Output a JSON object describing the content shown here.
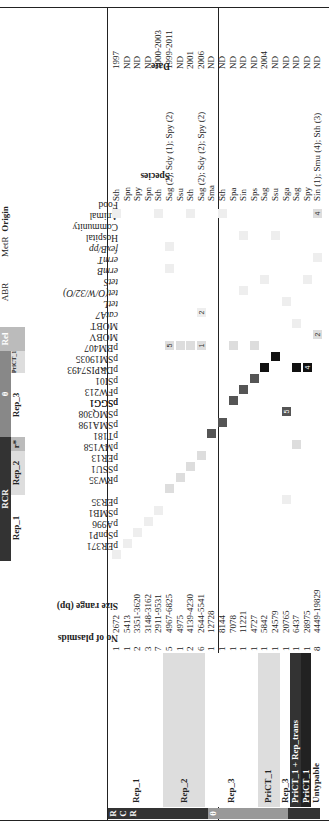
{
  "figure": {
    "rotation_deg": -90,
    "column_header_groups": [
      {
        "label": "RCR",
        "color": "#333333"
      },
      {
        "label": "Rep_1",
        "color": "#ffffff"
      },
      {
        "label": "Rep_2",
        "color": "#dddddd"
      },
      {
        "label": "r*",
        "color": "#bbbbbb"
      },
      {
        "label": "θ",
        "color": "#888888"
      },
      {
        "label": "Rep_3",
        "color": "#ffffff"
      },
      {
        "label": "PriCT_1",
        "color": "#dddddd"
      },
      {
        "label": "Rel",
        "color": "#bbbbbb"
      },
      {
        "label": "AB",
        "sup": "R"
      },
      {
        "label": "Met",
        "sup": "R"
      },
      {
        "label": "Origin"
      }
    ],
    "columns": [
      "No of plasmids",
      "Size range (bp)",
      "pER371",
      "pSpnP1",
      "pA996",
      "pSMB1",
      "pER35",
      "pSGG1",
      "pRW35",
      "pSSU1",
      "pER13",
      "pMV158",
      "pT181",
      "pSMA198",
      "pSMQ308",
      "pSGG1",
      "pFW213",
      "pSI01",
      "pDRPIS7493",
      "pSM19035",
      "pBM407",
      "MOBV",
      "MOBT",
      "catA7",
      "tetL",
      "tet(O/W/32/O)",
      "tetS",
      "ermB",
      "ermT",
      "fexB/pp",
      "Hospital",
      "Community",
      "Animal",
      "Food",
      "Species",
      "Date"
    ],
    "column_marks": {
      "pT181": "7",
      "pSM19035": "1"
    },
    "row_groups": [
      {
        "side": "R C R",
        "color": "#333333"
      },
      {
        "side": "θ",
        "color": "#999999"
      },
      {
        "side": "θ+RCR",
        "color": "#333333"
      }
    ],
    "rows": [
      {
        "group": "Rep_1",
        "n": "1",
        "size": "2672",
        "species": "Sth",
        "date": "1997"
      },
      {
        "group": "Rep_1",
        "n": "1",
        "size": "5413",
        "species": "Spn",
        "date": "ND"
      },
      {
        "group": "Rep_1",
        "n": "2",
        "size": "3351-3620",
        "species": "Spy",
        "date": "ND"
      },
      {
        "group": "Rep_1",
        "n": "3",
        "size": "3148-3162",
        "species": "Spn",
        "date": "ND"
      },
      {
        "group": "Rep_1",
        "n": "7",
        "size": "2911-9531",
        "species": "Sth",
        "date": "2000-2003"
      },
      {
        "group": "Rep_2",
        "n": "5",
        "size": "4967-6825",
        "species": "Sag (2); Sdy (1); Spy (2)",
        "date": "1999-2011"
      },
      {
        "group": "Rep_2",
        "n": "1",
        "size": "4975",
        "species": "Ssu",
        "date": "ND"
      },
      {
        "group": "Rep_2",
        "n": "2",
        "size": "4139-4230",
        "species": "Sth",
        "date": "2001"
      },
      {
        "group": "Rep_2",
        "n": "6",
        "size": "2644-5541",
        "species": "Sag (2); Sdy (2); Spy (2)",
        "date": "2006"
      },
      {
        "group": "Rep_3",
        "n": "1",
        "size": "12728",
        "species": "Sma",
        "date": "ND"
      },
      {
        "group": "Rep_3",
        "n": "1",
        "size": "8144",
        "species": "Sth",
        "date": "ND"
      },
      {
        "group": "Rep_3",
        "n": "1",
        "size": "7078",
        "species": "Spa",
        "date": "ND"
      },
      {
        "group": "Rep_3",
        "n": "1",
        "size": "11221",
        "species": "Sin",
        "date": "ND"
      },
      {
        "group": "Rep_3",
        "n": "1",
        "size": "4727",
        "species": "Sps",
        "date": "ND"
      },
      {
        "group": "PriCT_1",
        "n": "1",
        "size": "5842",
        "species": "Sag",
        "date": "2004"
      },
      {
        "group": "PriCT_1",
        "n": "1",
        "size": "24579",
        "species": "Ssu",
        "date": "ND"
      },
      {
        "group": "Rep_3",
        "n": "1",
        "size": "20765",
        "species": "Sga",
        "date": "ND"
      },
      {
        "group": "PriCT_1 + Rep_trans",
        "n": "1",
        "size": "6437",
        "species": "Sag",
        "date": "ND"
      },
      {
        "group": "PriCT_1",
        "n": "1",
        "size": "28975",
        "species": "Spy",
        "date": "ND"
      },
      {
        "group": "Untypable",
        "n": "8",
        "size": "4449-19829",
        "species": "Sin (1); Smu (4); Sth (3)",
        "date": "ND"
      }
    ],
    "row_group_labels": [
      {
        "label": "Rep_1",
        "rows": [
          0,
          4
        ],
        "bg": "#ffffff"
      },
      {
        "label": "Rep_2",
        "rows": [
          5,
          8
        ],
        "bg": "#dddddd"
      },
      {
        "label": "Rep_3",
        "rows": [
          9,
          13
        ],
        "bg": "#ffffff"
      },
      {
        "label": "PriCT_1",
        "rows": [
          14,
          15
        ],
        "bg": "#dddddd"
      },
      {
        "label": "Rep_3",
        "rows": [
          16,
          16
        ],
        "bg": "#ffffff"
      },
      {
        "label": "PriCT_1 + Rep_trans",
        "rows": [
          17,
          17
        ],
        "bg": "#333333"
      },
      {
        "label": "PriCT_1",
        "rows": [
          18,
          18
        ],
        "bg": "#222222"
      },
      {
        "label": "Untypable",
        "rows": [
          19,
          19
        ],
        "bg": "#ffffff"
      }
    ],
    "cells": [
      {
        "r": 0,
        "c": "pER371",
        "shade": "#eeeeee"
      },
      {
        "r": 1,
        "c": "pSpnP1",
        "shade": "#eeeeee"
      },
      {
        "r": 2,
        "c": "pA996",
        "shade": "#eeeeee"
      },
      {
        "r": 3,
        "c": "pSMB1",
        "shade": "#eeeeee"
      },
      {
        "r": 4,
        "c": "pER35",
        "shade": "#eeeeee"
      },
      {
        "r": 5,
        "c": "pRW35",
        "shade": "#dddddd"
      },
      {
        "r": 6,
        "c": "pSSU1",
        "shade": "#dddddd"
      },
      {
        "r": 7,
        "c": "pER13",
        "shade": "#dddddd"
      },
      {
        "r": 8,
        "c": "pMV158",
        "shade": "#dddddd"
      },
      {
        "r": 9,
        "c": "pSMA198",
        "shade": "#555555"
      },
      {
        "r": 10,
        "c": "pSMQ308",
        "shade": "#555555"
      },
      {
        "r": 11,
        "c": "pFW213",
        "shade": "#555555"
      },
      {
        "r": 12,
        "c": "pSI01",
        "shade": "#555555"
      },
      {
        "r": 13,
        "c": "pDRPIS7493",
        "shade": "#555555"
      },
      {
        "r": 14,
        "c": "pSM19035",
        "shade": "#111111"
      },
      {
        "r": 15,
        "c": "pBM407",
        "shade": "#111111"
      },
      {
        "r": 16,
        "c": "pSGG1",
        "shade": "#555555",
        "text": "5"
      },
      {
        "r": 17,
        "c": "pSM19035",
        "shade": "#111111"
      },
      {
        "r": 18,
        "c": "pSM19035",
        "shade": "#111111",
        "text": "4"
      },
      {
        "r": 16,
        "c": "pSGG1b",
        "shade": "#eeeeee"
      },
      {
        "r": 17,
        "c": "pT181",
        "shade": "#dddddd"
      },
      {
        "r": 5,
        "c": "MOBV",
        "shade": "#dddddd",
        "text": "5"
      },
      {
        "r": 6,
        "c": "MOBV",
        "shade": "#dddddd"
      },
      {
        "r": 7,
        "c": "MOBV",
        "shade": "#dddddd"
      },
      {
        "r": 8,
        "c": "MOBV",
        "shade": "#dddddd",
        "text": "1"
      },
      {
        "r": 11,
        "c": "MOBV",
        "shade": "#dddddd"
      },
      {
        "r": 13,
        "c": "MOBV",
        "shade": "#dddddd"
      },
      {
        "r": 19,
        "c": "MOBT",
        "shade": "#dddddd",
        "text": "2"
      },
      {
        "r": 17,
        "c": "catA7",
        "shade": "#eeeeee"
      },
      {
        "r": 8,
        "c": "tetL",
        "shade": "#eeeeee",
        "text": "2"
      },
      {
        "r": 16,
        "c": "tet(O/W/32/O)",
        "shade": "#eeeeee"
      },
      {
        "r": 12,
        "c": "tetS",
        "shade": "#eeeeee"
      },
      {
        "r": 14,
        "c": "ermB",
        "shade": "#eeeeee"
      },
      {
        "r": 18,
        "c": "ermB",
        "shade": "#eeeeee"
      },
      {
        "r": 5,
        "c": "ermT",
        "shade": "#eeeeee"
      },
      {
        "r": 19,
        "c": "fexB/pp",
        "shade": "#eeeeee"
      },
      {
        "r": 5,
        "c": "Hospital",
        "shade": "#eeeeee"
      },
      {
        "r": 12,
        "c": "Community",
        "shade": "#eeeeee"
      },
      {
        "r": 15,
        "c": "Community",
        "shade": "#eeeeee"
      },
      {
        "r": 0,
        "c": "Food",
        "shade": "#eeeeee"
      },
      {
        "r": 4,
        "c": "Food",
        "shade": "#eeeeee"
      },
      {
        "r": 7,
        "c": "Food",
        "shade": "#eeeeee"
      },
      {
        "r": 10,
        "c": "Food",
        "shade": "#eeeeee"
      },
      {
        "r": 19,
        "c": "Food",
        "shade": "#dddddd",
        "text": "4"
      }
    ]
  }
}
